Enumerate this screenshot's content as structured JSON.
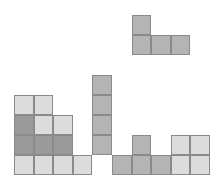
{
  "game": {
    "type": "tetris-like block stacking",
    "grid": {
      "origin_x": 14,
      "origin_y": 15,
      "cell_w": 19.6,
      "cell_h": 20,
      "columns": 10,
      "rows": 8
    },
    "colors": {
      "dark": "#9a9a9a",
      "medium": "#b4b4b4",
      "light": "#dcdcdc",
      "border": "#8a8a8a"
    },
    "falling_piece": {
      "shape": "J",
      "cells": [
        {
          "r": 0,
          "c": 6,
          "shade": "medium"
        },
        {
          "r": 1,
          "c": 6,
          "shade": "medium"
        },
        {
          "r": 1,
          "c": 7,
          "shade": "medium"
        },
        {
          "r": 1,
          "c": 8,
          "shade": "medium"
        }
      ]
    },
    "stacked_cells": [
      {
        "r": 3,
        "c": 4,
        "shade": "medium"
      },
      {
        "r": 4,
        "c": 4,
        "shade": "medium"
      },
      {
        "r": 5,
        "c": 4,
        "shade": "medium"
      },
      {
        "r": 6,
        "c": 4,
        "shade": "medium"
      },
      {
        "r": 4,
        "c": 0,
        "shade": "light"
      },
      {
        "r": 5,
        "c": 0,
        "shade": "dark"
      },
      {
        "r": 6,
        "c": 0,
        "shade": "dark"
      },
      {
        "r": 7,
        "c": 0,
        "shade": "light"
      },
      {
        "r": 4,
        "c": 1,
        "shade": "light"
      },
      {
        "r": 5,
        "c": 1,
        "shade": "light"
      },
      {
        "r": 6,
        "c": 1,
        "shade": "dark"
      },
      {
        "r": 7,
        "c": 1,
        "shade": "light"
      },
      {
        "r": 5,
        "c": 2,
        "shade": "light"
      },
      {
        "r": 6,
        "c": 2,
        "shade": "dark"
      },
      {
        "r": 7,
        "c": 2,
        "shade": "light"
      },
      {
        "r": 7,
        "c": 3,
        "shade": "light"
      },
      {
        "r": 7,
        "c": 5,
        "shade": "medium"
      },
      {
        "r": 6,
        "c": 6,
        "shade": "medium"
      },
      {
        "r": 7,
        "c": 6,
        "shade": "medium"
      },
      {
        "r": 7,
        "c": 7,
        "shade": "medium"
      },
      {
        "r": 6,
        "c": 8,
        "shade": "light"
      },
      {
        "r": 7,
        "c": 8,
        "shade": "light"
      },
      {
        "r": 6,
        "c": 9,
        "shade": "light"
      },
      {
        "r": 7,
        "c": 9,
        "shade": "light"
      }
    ]
  }
}
